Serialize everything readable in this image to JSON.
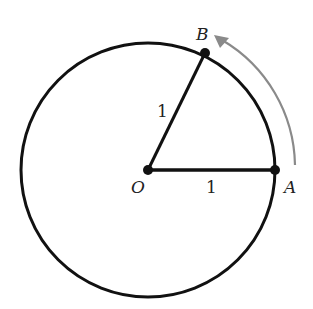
{
  "diagram": {
    "points": {
      "O": {
        "label": "O",
        "x": 148,
        "y": 170
      },
      "A": {
        "label": "A",
        "x": 275,
        "y": 170
      },
      "B": {
        "label": "B",
        "x": 205,
        "y": 53
      }
    },
    "circle": {
      "cx": 148,
      "cy": 170,
      "r": 127
    },
    "segments": [
      {
        "from": "O",
        "to": "A",
        "length_label": "1"
      },
      {
        "from": "O",
        "to": "B",
        "length_label": "1"
      }
    ],
    "arrow": {
      "description": "counterclockwise arc from A toward B",
      "color": "#8a8a8a"
    },
    "colors": {
      "stroke": "#111111",
      "arrow": "#8a8a8a",
      "background": "#ffffff"
    }
  }
}
